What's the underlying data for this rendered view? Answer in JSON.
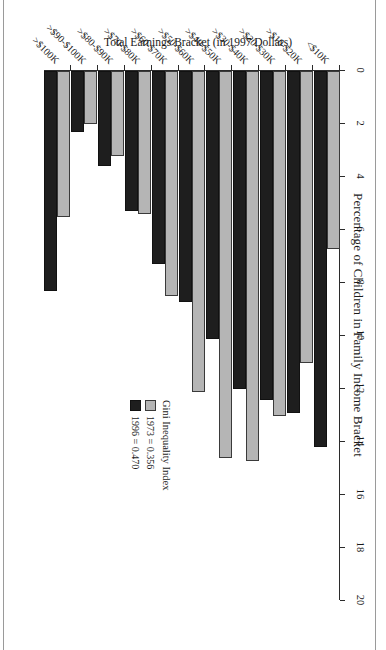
{
  "chart_data": {
    "type": "bar",
    "orientation": "horizontal",
    "title": "Percentage of Children in Family Income Bracket",
    "xlabel": "Percentage of Children in Family Income Bracket",
    "ylabel": "Total Earnings Bracket (in 1997 Dollars)",
    "xlim": [
      0,
      20
    ],
    "xticks": [
      "0",
      "2",
      "4",
      "6",
      "8",
      "10",
      "12",
      "14",
      "16",
      "18",
      "20"
    ],
    "xtick_values": [
      0,
      2,
      4,
      6,
      8,
      10,
      12,
      14,
      16,
      18,
      20
    ],
    "grid": false,
    "legend_position": "inside-right",
    "legend_title": "Gini Inequality Index",
    "categories": [
      "<$10K",
      ">$10-$20K",
      ">$20-$30K",
      ">$30-$40K",
      ">$40-$50K",
      ">$50-$60K",
      ">$60-$70K",
      ">$70-$80K",
      ">$80-$90K",
      ">$90-$100K",
      ">$100K"
    ],
    "series": [
      {
        "name": "1973 = 0.356",
        "year": "1973",
        "gini": "0.356",
        "color": "#b5b5b5",
        "values": [
          6.7,
          11.0,
          13.0,
          14.7,
          14.6,
          12.1,
          8.5,
          5.4,
          3.2,
          2.0,
          5.5
        ]
      },
      {
        "name": "1996 = 0.470",
        "year": "1996",
        "gini": "0.470",
        "color": "#1e1e1e",
        "values": [
          14.2,
          12.9,
          12.4,
          12.0,
          10.1,
          8.7,
          7.3,
          5.3,
          3.6,
          2.3,
          8.3
        ]
      }
    ]
  },
  "legend": {
    "title": "Gini Inequality Index",
    "entries": [
      {
        "label": "1973 = 0.356",
        "color": "#b5b5b5"
      },
      {
        "label": "1996 = 0.470",
        "color": "#1e1e1e"
      }
    ]
  },
  "colors": {
    "series_1973": "#b5b5b5",
    "series_1996": "#1e1e1e",
    "axis": "#2b2b2b",
    "page_rule": "#9a9a9a",
    "background": "#ffffff"
  }
}
